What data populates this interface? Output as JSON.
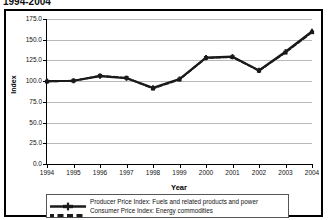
{
  "title": "1994-2004",
  "axis": {
    "y_title": "Index",
    "x_title": "Year"
  },
  "chart_data": {
    "type": "line",
    "title": "1994-2004",
    "xlabel": "Year",
    "ylabel": "Index",
    "ylim": [
      0.0,
      175.0
    ],
    "xlim": [
      "1994",
      "2004"
    ],
    "grid": true,
    "legend_position": "bottom",
    "y_ticks": [
      "0.0",
      "25.0",
      "50.0",
      "75.0",
      "100.0",
      "125.0",
      "150.0",
      "175.0"
    ],
    "y_tick_values": [
      0.0,
      25.0,
      50.0,
      75.0,
      100.0,
      125.0,
      150.0,
      175.0
    ],
    "categories": [
      "1994",
      "1995",
      "1996",
      "1997",
      "1998",
      "1999",
      "2000",
      "2001",
      "2002",
      "2003",
      "2004"
    ],
    "x": [
      1994,
      1995,
      1996,
      1997,
      1998,
      1999,
      2000,
      2001,
      2002,
      2003,
      2004
    ],
    "series": [
      {
        "name": "Producer Price Index: Fuels and related products and power",
        "marker": "plus",
        "style": "solid",
        "color": "#1a1a1a",
        "values": [
          100.0,
          100.5,
          106.0,
          103.5,
          92.0,
          102.5,
          128.5,
          129.5,
          113.0,
          135.5,
          160.0
        ]
      },
      {
        "name": "Consumer Price Index: Energy commodities",
        "marker": "square",
        "style": "dashed",
        "color": "#1a1a1a",
        "values": [
          99.5,
          100.5,
          106.5,
          104.0,
          91.0,
          102.0,
          128.0,
          129.0,
          112.5,
          134.5,
          159.0
        ]
      }
    ]
  },
  "legend": {
    "items": [
      {
        "label": "Producer Price Index: Fuels and related products and power",
        "marker": "plus-solid-line"
      },
      {
        "label": "Consumer Price Index: Energy commodities",
        "marker": "square-dashed-line"
      }
    ]
  }
}
